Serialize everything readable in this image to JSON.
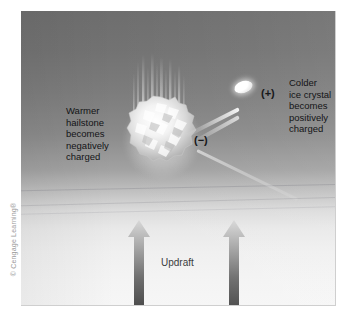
{
  "figure": {
    "credit": "© Cengage Learning®"
  },
  "panel": {
    "background_top_color": "#6e6e6e",
    "background_bottom_color": "#f6f6f6"
  },
  "labels": {
    "left_caption": "Warmer\nhailstone\nbecomes\nnegatively\ncharged",
    "right_caption": "Colder\nice crystal\nbecomes\npositively\ncharged",
    "negative_charge": "(−)",
    "positive_charge": "(+)",
    "updraft": "Updraft"
  },
  "elements": {
    "hailstone_name": "hailstone",
    "ice_crystal_name": "ice-crystal",
    "arrow_left_name": "updraft-arrow-left",
    "arrow_right_name": "updraft-arrow-right"
  },
  "colors": {
    "text": "#131416",
    "charge_text": "#17181a",
    "updraft_text": "#3a3c40",
    "credit_text": "#9a9a9a",
    "arrow_dark": "#4a4a4a",
    "arrow_light": "#d8d8d8",
    "ice_white": "#ffffff"
  }
}
